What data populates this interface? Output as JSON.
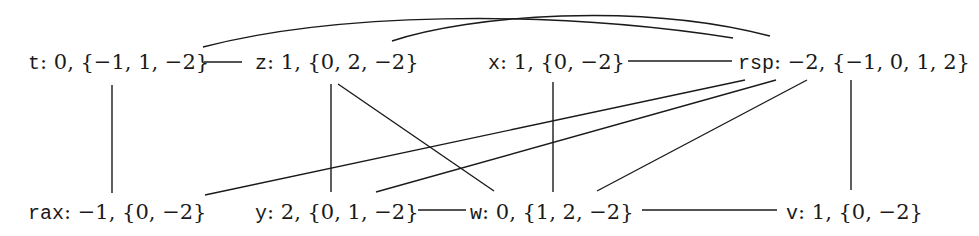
{
  "diagram": {
    "type": "interference-graph",
    "nodes": [
      {
        "id": "t",
        "var": "t",
        "rest": ": 0, {−1, 1, −2}",
        "row": "top"
      },
      {
        "id": "z",
        "var": "z",
        "rest": ": 1, {0, 2, −2}",
        "row": "top"
      },
      {
        "id": "x",
        "var": "x",
        "rest": ": 1, {0, −2}",
        "row": "top"
      },
      {
        "id": "rsp",
        "var": "rsp",
        "rest": ": −2, {−1, 0, 1, 2}",
        "row": "top"
      },
      {
        "id": "rax",
        "var": "rax",
        "rest": ": −1, {0, −2}",
        "row": "bottom"
      },
      {
        "id": "y",
        "var": "y",
        "rest": ": 2, {0, 1, −2}",
        "row": "bottom"
      },
      {
        "id": "w",
        "var": "w",
        "rest": ": 0, {1, 2, −2}",
        "row": "bottom"
      },
      {
        "id": "v",
        "var": "v",
        "rest": ": 1, {0, −2}",
        "row": "bottom"
      }
    ],
    "edges": [
      [
        "t",
        "z"
      ],
      [
        "t",
        "rsp"
      ],
      [
        "z",
        "rsp"
      ],
      [
        "x",
        "rsp"
      ],
      [
        "t",
        "rax"
      ],
      [
        "z",
        "y"
      ],
      [
        "z",
        "w"
      ],
      [
        "x",
        "w"
      ],
      [
        "rsp",
        "rax"
      ],
      [
        "rsp",
        "y"
      ],
      [
        "rsp",
        "w"
      ],
      [
        "rsp",
        "v"
      ],
      [
        "y",
        "w"
      ],
      [
        "w",
        "v"
      ]
    ]
  }
}
